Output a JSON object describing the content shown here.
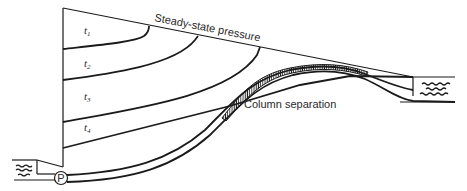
{
  "diagram": {
    "labels": {
      "steady_state": "Steady-state pressure",
      "column_separation": "Column separation",
      "pump": "P"
    },
    "time_labels": [
      {
        "base": "t",
        "sub": "1"
      },
      {
        "base": "t",
        "sub": "2"
      },
      {
        "base": "t",
        "sub": "3"
      },
      {
        "base": "t",
        "sub": "4"
      }
    ]
  }
}
